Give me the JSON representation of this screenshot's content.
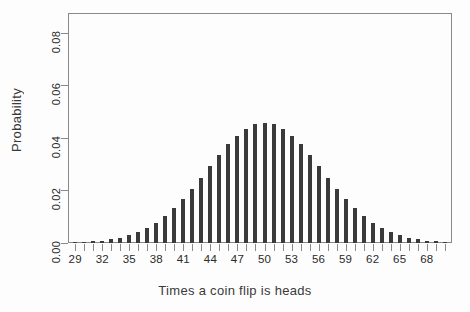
{
  "chart_data": {
    "type": "bar",
    "title": "",
    "xlabel": "Times a coin flip is heads",
    "ylabel": "Probability",
    "xlim": [
      28.2,
      70.8
    ],
    "ylim": [
      0.0,
      0.0875
    ],
    "grid": false,
    "legend": null,
    "bar_color": "#3a3a3a",
    "frame_color": "#8a8a8a",
    "background_color": "#fdfdfd",
    "xtick_labels": [
      "29",
      "32",
      "35",
      "38",
      "41",
      "44",
      "47",
      "50",
      "53",
      "56",
      "59",
      "62",
      "65",
      "68"
    ],
    "xtick_label_values": [
      29,
      32,
      35,
      38,
      41,
      44,
      47,
      50,
      53,
      56,
      59,
      62,
      65,
      68
    ],
    "xtick_all_values": [
      29,
      30,
      31,
      32,
      33,
      34,
      35,
      36,
      37,
      38,
      39,
      40,
      41,
      42,
      43,
      44,
      45,
      46,
      47,
      48,
      49,
      50,
      51,
      52,
      53,
      54,
      55,
      56,
      57,
      58,
      59,
      60,
      61,
      62,
      63,
      64,
      65,
      66,
      67,
      68,
      69,
      70
    ],
    "ytick_labels": [
      "0.00",
      "0.02",
      "0.04",
      "0.06",
      "0.08"
    ],
    "ytick_values": [
      0.0,
      0.02,
      0.04,
      0.06,
      0.08
    ],
    "categories": [
      29,
      30,
      31,
      32,
      33,
      34,
      35,
      36,
      37,
      38,
      39,
      40,
      41,
      42,
      43,
      44,
      45,
      46,
      47,
      48,
      49,
      50,
      51,
      52,
      53,
      54,
      55,
      56,
      57,
      58,
      59,
      60,
      61,
      62,
      63,
      64,
      65,
      66,
      67,
      68,
      69,
      70
    ],
    "values": [
      0.0002,
      0.0004,
      0.0006,
      0.0009,
      0.0014,
      0.002,
      0.003,
      0.0042,
      0.0058,
      0.0078,
      0.0103,
      0.0133,
      0.0167,
      0.0206,
      0.0248,
      0.0292,
      0.0335,
      0.0375,
      0.0409,
      0.0435,
      0.0452,
      0.0458,
      0.0452,
      0.0435,
      0.0409,
      0.0375,
      0.0335,
      0.0292,
      0.0248,
      0.0206,
      0.0167,
      0.0133,
      0.0103,
      0.0078,
      0.0058,
      0.0042,
      0.003,
      0.002,
      0.0014,
      0.0009,
      0.0006,
      0.0004
    ]
  }
}
